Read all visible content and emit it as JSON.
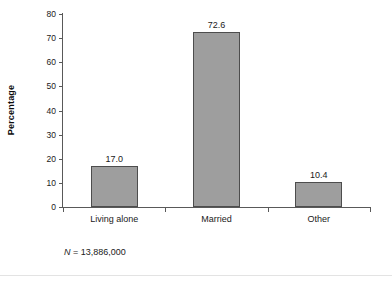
{
  "chart_data": {
    "type": "bar",
    "title": "",
    "subtitle": "",
    "xlabel": "",
    "ylabel": "Percentage",
    "categories": [
      "Living alone",
      "Married",
      "Other"
    ],
    "values": [
      17.0,
      72.6,
      10.4
    ],
    "value_labels": [
      "17.0",
      "72.6",
      "10.4"
    ],
    "ylim": [
      0,
      80
    ],
    "ytick_labels": [
      "0",
      "10",
      "20",
      "30",
      "40",
      "50",
      "60",
      "70",
      "80"
    ],
    "ytick_values": [
      0,
      10,
      20,
      30,
      40,
      50,
      60,
      70,
      80
    ],
    "grid": false,
    "legend": false,
    "legend_position": "none",
    "annotations": [
      {
        "name": "sample-size",
        "symbol": "N",
        "text": " = 13,886,000"
      }
    ],
    "colors": {
      "bar_fill": "#9e9e9e",
      "bar_border": "#4d4d4d",
      "axis": "#595959",
      "text": "#1a1a1a",
      "background": "#ffffff",
      "rule": "#e3e3e3"
    }
  }
}
